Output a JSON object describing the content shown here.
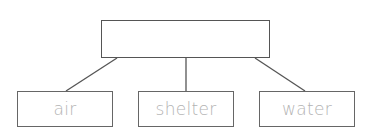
{
  "diagram": {
    "type": "tree",
    "root": {
      "label": ""
    },
    "children": [
      {
        "label": "air"
      },
      {
        "label": "shelter"
      },
      {
        "label": "water"
      }
    ],
    "colors": {
      "line": "#555555",
      "child_text": "#b3b3b3"
    }
  }
}
